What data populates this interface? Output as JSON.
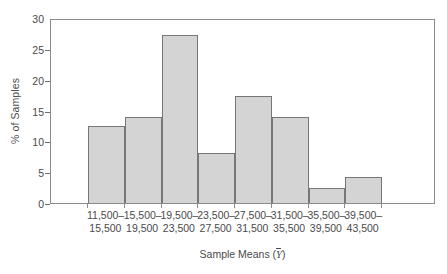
{
  "chart_data": {
    "type": "bar",
    "title": "",
    "subtitle": "",
    "xlabel": "Sample Means (Ȳ)",
    "ylabel": "% of Samples",
    "xlabel_prefix": "Sample Means (",
    "xlabel_variable": "Y",
    "xlabel_suffix": ")",
    "categories": [
      "11,500–15,500",
      "15,500–19,500",
      "19,500–23,500",
      "23,500–27,500",
      "27,500–31,500",
      "31,500–35,500",
      "35,500–39,500",
      "39,500–43,500"
    ],
    "category_lines": [
      {
        "line1": "11,500–",
        "line2": "15,500"
      },
      {
        "line1": "15,500–",
        "line2": "19,500"
      },
      {
        "line1": "19,500–",
        "line2": "23,500"
      },
      {
        "line1": "23,500–",
        "line2": "27,500"
      },
      {
        "line1": "27,500–",
        "line2": "31,500"
      },
      {
        "line1": "31,500–",
        "line2": "35,500"
      },
      {
        "line1": "35,500–",
        "line2": "39,500"
      },
      {
        "line1": "39,500–",
        "line2": "43,500"
      }
    ],
    "values": [
      12.5,
      13.9,
      27.3,
      8.1,
      17.3,
      13.9,
      2.5,
      4.2
    ],
    "ylim": [
      0,
      30
    ],
    "yticks": [
      0,
      5,
      10,
      15,
      20,
      25,
      30
    ],
    "ytick_labels": [
      "0",
      "5",
      "10",
      "15",
      "20",
      "25",
      "30"
    ],
    "grid": false,
    "legend": false,
    "bar_fill_color": "#d4d4d4",
    "bar_border_color": "#777777",
    "axis_color": "#8a8a8a",
    "text_color": "#4a4a4a",
    "background_color": "#ffffff"
  }
}
